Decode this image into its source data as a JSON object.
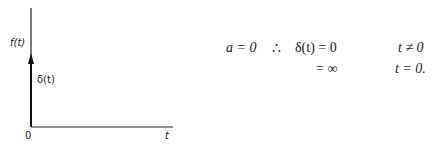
{
  "figure": {
    "y_axis_label": "f(t)",
    "impulse_label": "δ(t)",
    "origin_label": "0",
    "x_axis_label": "t"
  },
  "equation": {
    "condition": "a = 0",
    "therefore": "∴",
    "line1_lhs": "δ(t) = 0",
    "line1_cond": "t ≠ 0",
    "line2_lhs": "= ∞",
    "line2_cond": "t = 0."
  }
}
